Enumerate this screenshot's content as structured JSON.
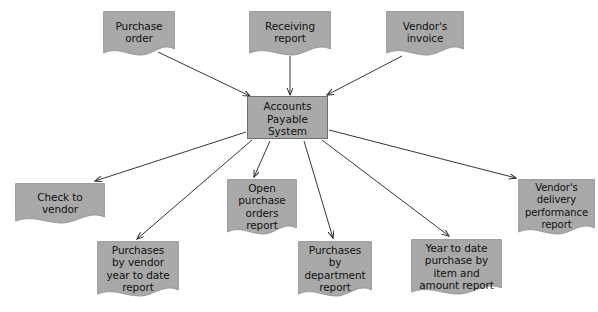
{
  "diagram": {
    "colors": {
      "node_fill": "#a9a9a9",
      "node_stroke": "#6f6f6f",
      "arrow": "#2b2b2b",
      "text": "#111111",
      "background": "#ffffff"
    },
    "process": {
      "name": "accounts-payable-system",
      "label": "Accounts\nPayable\nSystem",
      "shape": "rectangle"
    },
    "inputs": [
      {
        "name": "purchase-order",
        "label": "Purchase\norder",
        "shape": "document"
      },
      {
        "name": "receiving-report",
        "label": "Receiving\nreport",
        "shape": "document"
      },
      {
        "name": "vendors-invoice",
        "label": "Vendor's\ninvoice",
        "shape": "document"
      }
    ],
    "outputs": [
      {
        "name": "check-to-vendor",
        "label": "Check to\nvendor",
        "shape": "document"
      },
      {
        "name": "purchases-by-vendor-year-to-date-report",
        "label": "Purchases\nby vendor\nyear to date\nreport",
        "shape": "document"
      },
      {
        "name": "open-purchase-orders-report",
        "label": "Open\npurchase\norders\nreport",
        "shape": "document"
      },
      {
        "name": "purchases-by-department-report",
        "label": "Purchases\nby\ndepartment\nreport",
        "shape": "document"
      },
      {
        "name": "year-to-date-purchase-by-item-and-amount-report",
        "label": "Year to date\npurchase by\nitem and\namount report",
        "shape": "document"
      },
      {
        "name": "vendors-delivery-performance-report",
        "label": "Vendor's\ndelivery\nperformance\nreport",
        "shape": "document"
      }
    ],
    "connections": [
      {
        "name": "arrow-purchase-order-to-system",
        "from": "purchase-order",
        "to": "accounts-payable-system",
        "direction": "in"
      },
      {
        "name": "arrow-receiving-report-to-system",
        "from": "receiving-report",
        "to": "accounts-payable-system",
        "direction": "in"
      },
      {
        "name": "arrow-vendors-invoice-to-system",
        "from": "vendors-invoice",
        "to": "accounts-payable-system",
        "direction": "in"
      },
      {
        "name": "arrow-system-to-check-to-vendor",
        "from": "accounts-payable-system",
        "to": "check-to-vendor",
        "direction": "out"
      },
      {
        "name": "arrow-system-to-purchases-by-vendor",
        "from": "accounts-payable-system",
        "to": "purchases-by-vendor-year-to-date-report",
        "direction": "out"
      },
      {
        "name": "arrow-system-to-open-purchase-orders",
        "from": "accounts-payable-system",
        "to": "open-purchase-orders-report",
        "direction": "out"
      },
      {
        "name": "arrow-system-to-purchases-by-department",
        "from": "accounts-payable-system",
        "to": "purchases-by-department-report",
        "direction": "out"
      },
      {
        "name": "arrow-system-to-year-to-date-purchase",
        "from": "accounts-payable-system",
        "to": "year-to-date-purchase-by-item-and-amount-report",
        "direction": "out"
      },
      {
        "name": "arrow-system-to-vendors-delivery-performance",
        "from": "accounts-payable-system",
        "to": "vendors-delivery-performance-report",
        "direction": "out"
      }
    ]
  }
}
